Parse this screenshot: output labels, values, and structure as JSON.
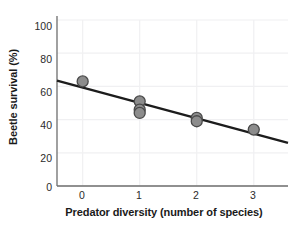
{
  "chart_data": {
    "type": "scatter",
    "title": "",
    "xlabel": "Predator diversity (number of species)",
    "ylabel": "Beetle survival (%)",
    "xlim": [
      -0.45,
      3.6
    ],
    "ylim": [
      0,
      100
    ],
    "xticks": [
      0,
      1,
      2,
      3
    ],
    "xtick_labels": [
      "0",
      "1",
      "2",
      "3"
    ],
    "yticks": [
      0,
      20,
      40,
      60,
      80,
      100
    ],
    "ytick_labels": [
      "0",
      "20",
      "40",
      "60",
      "80",
      "100"
    ],
    "grid": true,
    "grid_color": "#f0f0f2",
    "legend": "none",
    "marker": {
      "shape": "circle",
      "fill_color": "#8c8c8c",
      "edge_color": "#4a4a4a",
      "size_px": 11
    },
    "points": [
      {
        "x": 0,
        "y": 63
      },
      {
        "x": 1,
        "y": 51
      },
      {
        "x": 1,
        "y": 46
      },
      {
        "x": 1,
        "y": 44
      },
      {
        "x": 2,
        "y": 41
      },
      {
        "x": 2,
        "y": 39
      },
      {
        "x": 3,
        "y": 34
      }
    ],
    "trendline": {
      "type": "linear",
      "color": "#1c1c1c",
      "width_px": 2.4,
      "x_start": -0.45,
      "y_start": 63.5,
      "x_end": 3.6,
      "y_end": 26.0,
      "intercept": 59.3,
      "slope": -9.26
    },
    "axis_color": "#6e6e6e"
  }
}
